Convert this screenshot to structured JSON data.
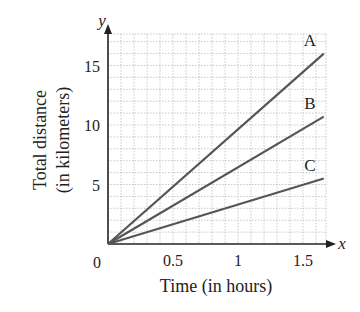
{
  "chart_data": {
    "type": "line",
    "title": "",
    "xlabel": "Time (in hours)",
    "ylabel_line1": "Total distance",
    "ylabel_line2": "(in kilometers)",
    "x_axis_letter": "x",
    "y_axis_letter": "y",
    "origin_label": "0",
    "xticks": [
      {
        "value": 0.5,
        "label": "0.5"
      },
      {
        "value": 1,
        "label": "1"
      },
      {
        "value": 1.5,
        "label": "1.5"
      }
    ],
    "yticks": [
      {
        "value": 5,
        "label": "5"
      },
      {
        "value": 10,
        "label": "10"
      },
      {
        "value": 15,
        "label": "15"
      }
    ],
    "xlim": [
      0,
      1.7
    ],
    "ylim": [
      0,
      17
    ],
    "grid": true,
    "grid_step_x": 0.1,
    "grid_step_y": 1,
    "series": [
      {
        "name": "A",
        "x": [
          0,
          1.66
        ],
        "y": [
          0,
          16.0
        ]
      },
      {
        "name": "B",
        "x": [
          0,
          1.66
        ],
        "y": [
          0,
          10.7
        ]
      },
      {
        "name": "C",
        "x": [
          0,
          1.66
        ],
        "y": [
          0,
          5.5
        ]
      }
    ],
    "colors": {
      "line": "#555555",
      "axis": "#222222",
      "grid": "#bbbbbb"
    }
  }
}
